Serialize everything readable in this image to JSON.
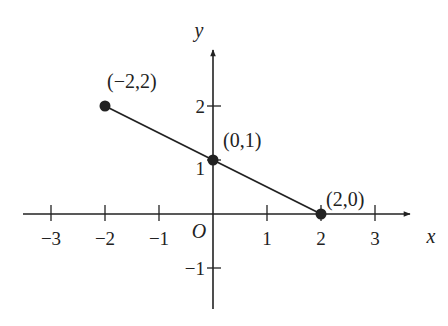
{
  "chart_data": {
    "type": "line",
    "title": "",
    "xlabel": "x",
    "ylabel": "y",
    "xlim": [
      -3.5,
      3.5
    ],
    "ylim": [
      -1.8,
      3.0
    ],
    "grid": false,
    "legend": null,
    "x_ticks": [
      -3,
      -2,
      -1,
      1,
      2,
      3
    ],
    "x_tick_labels": [
      "−3",
      "−2",
      "−1",
      "1",
      "2",
      "3"
    ],
    "y_ticks": [
      -1,
      1,
      2
    ],
    "y_tick_labels": [
      "−1",
      "1",
      "2"
    ],
    "origin_label": "O",
    "series": [
      {
        "name": "segment",
        "x": [
          -2,
          0,
          2
        ],
        "y": [
          2,
          1,
          0
        ],
        "markers": true
      }
    ],
    "annotations": [
      {
        "text": "(−2,2)",
        "x": -2,
        "y": 2
      },
      {
        "text": "(0,1)",
        "x": 0,
        "y": 1
      },
      {
        "text": "(2,0)",
        "x": 2,
        "y": 0
      }
    ]
  },
  "colors": {
    "ink": "#222222",
    "background": "#ffffff"
  }
}
